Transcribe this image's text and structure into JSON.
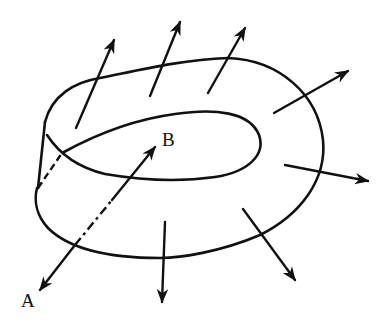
{
  "figure": {
    "labels": {
      "A": "A",
      "B": "B"
    },
    "colors": {
      "stroke": "#111111",
      "background": "#ffffff"
    },
    "normal_vector_count": 7
  }
}
